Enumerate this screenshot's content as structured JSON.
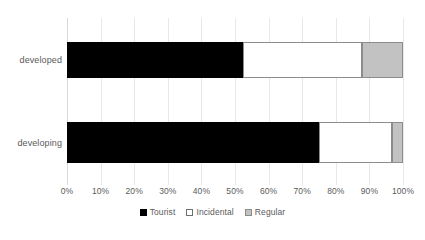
{
  "chart_data": {
    "type": "bar",
    "orientation": "horizontal",
    "stacked": true,
    "stack_mode": "percent",
    "title": "",
    "subtitle": "",
    "xlabel": "",
    "ylabel": "",
    "xlim": [
      0,
      100
    ],
    "grid": true,
    "grid_axis": "x",
    "legend_position": "bottom",
    "categories": [
      "developed",
      "developing"
    ],
    "tick_labels": [
      "0%",
      "10%",
      "20%",
      "30%",
      "40%",
      "50%",
      "60%",
      "70%",
      "80%",
      "90%",
      "100%"
    ],
    "tick_values": [
      0,
      10,
      20,
      30,
      40,
      50,
      60,
      70,
      80,
      90,
      100
    ],
    "series": [
      {
        "name": "Tourist",
        "color": "#000000",
        "border_color": "#000000",
        "values": [
          52.5,
          75.0
        ]
      },
      {
        "name": "Incidental",
        "color": "#ffffff",
        "border_color": "#8c8c8c",
        "values": [
          35.3,
          21.7
        ]
      },
      {
        "name": "Regular",
        "color": "#c2c2c2",
        "border_color": "#8c8c8c",
        "values": [
          12.2,
          3.3
        ]
      }
    ]
  }
}
